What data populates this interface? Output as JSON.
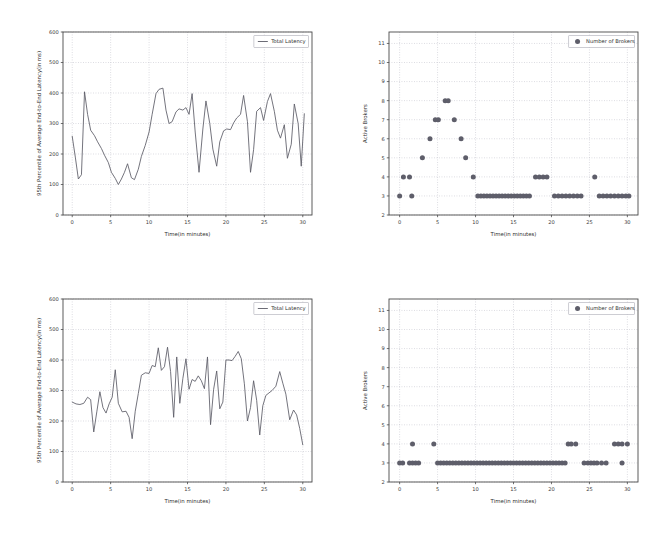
{
  "figure": {
    "background_color": "#ffffff",
    "line_color": "#5b5b66",
    "marker_color": "#5e5e6a",
    "grid_color": "#b9b9c4",
    "axis_color": "#4a4a4a",
    "panel_count": 4,
    "layout": "2x2"
  },
  "panels": [
    {
      "id": "top-left-latency",
      "position": "top-left",
      "legend_label": "Total Latency",
      "legend_icon": "line-swatch",
      "xlabel": "Time(in minutes)",
      "ylabel": "95th Percentile of Average End-to-End Latency(in ms)",
      "xticks": [
        "0",
        "5",
        "10",
        "15",
        "20",
        "25",
        "30"
      ],
      "yticks": [
        "0",
        "100",
        "200",
        "300",
        "400",
        "500",
        "600"
      ]
    },
    {
      "id": "top-right-brokers",
      "position": "top-right",
      "legend_label": "Number of Brokers",
      "legend_icon": "dot-swatch",
      "xlabel": "Time(in minutes)",
      "ylabel": "Active Brokers",
      "xticks": [
        "0",
        "5",
        "10",
        "15",
        "20",
        "25",
        "30"
      ],
      "yticks": [
        "2",
        "3",
        "4",
        "5",
        "6",
        "7",
        "8",
        "9",
        "10",
        "11"
      ]
    },
    {
      "id": "bottom-left-latency",
      "position": "bottom-left",
      "legend_label": "Total Latency",
      "legend_icon": "line-swatch",
      "xlabel": "Time(in minutes)",
      "ylabel": "95th Percentile of Average End-to-End Latency(in ms)",
      "xticks": [
        "0",
        "5",
        "10",
        "15",
        "20",
        "25",
        "30"
      ],
      "yticks": [
        "0",
        "100",
        "200",
        "300",
        "400",
        "500",
        "600"
      ]
    },
    {
      "id": "bottom-right-brokers",
      "position": "bottom-right",
      "legend_label": "Number of Brokers",
      "legend_icon": "dot-swatch",
      "xlabel": "Time(in minutes)",
      "ylabel": "Active Brokers",
      "xticks": [
        "0",
        "5",
        "10",
        "15",
        "20",
        "25",
        "30"
      ],
      "yticks": [
        "2",
        "3",
        "4",
        "5",
        "6",
        "7",
        "8",
        "9",
        "10",
        "11"
      ]
    }
  ],
  "chart_data": [
    {
      "type": "line",
      "id": "top-left-latency",
      "title": "",
      "xlabel": "Time(in minutes)",
      "ylabel": "95th Percentile of Average End-to-End Latency(in ms)",
      "xlim": [
        -1.2,
        31.2
      ],
      "ylim": [
        0,
        600
      ],
      "xticks": [
        0,
        5,
        10,
        15,
        20,
        25,
        30
      ],
      "yticks": [
        0,
        100,
        200,
        300,
        400,
        500,
        600
      ],
      "grid": true,
      "legend": [
        "Total Latency"
      ],
      "legend_position": "upper right",
      "series": [
        {
          "name": "Total Latency",
          "x": [
            0.0,
            0.4,
            0.8,
            1.2,
            1.6,
            2.0,
            2.4,
            2.9,
            3.3,
            3.8,
            4.2,
            4.7,
            5.1,
            5.6,
            6.0,
            6.4,
            6.8,
            7.2,
            7.7,
            8.1,
            8.6,
            9.0,
            9.5,
            10.0,
            10.4,
            10.9,
            11.3,
            11.8,
            12.2,
            12.6,
            13.0,
            13.5,
            13.9,
            14.4,
            14.8,
            15.2,
            15.6,
            16.0,
            16.5,
            17.0,
            17.4,
            17.9,
            18.3,
            18.8,
            19.2,
            19.7,
            20.1,
            20.6,
            21.0,
            21.4,
            21.9,
            22.3,
            22.8,
            23.2,
            23.6,
            24.0,
            24.5,
            24.9,
            25.4,
            25.8,
            26.3,
            26.7,
            27.1,
            27.6,
            28.0,
            28.5,
            28.9,
            29.4,
            29.8,
            30.2
          ],
          "y": [
            258,
            190,
            118,
            132,
            404,
            330,
            278,
            260,
            240,
            218,
            196,
            172,
            140,
            120,
            100,
            118,
            140,
            168,
            122,
            116,
            150,
            192,
            228,
            272,
            330,
            398,
            412,
            416,
            344,
            300,
            306,
            338,
            348,
            344,
            352,
            330,
            398,
            272,
            140,
            282,
            374,
            300,
            216,
            160,
            240,
            276,
            282,
            280,
            302,
            318,
            330,
            392,
            306,
            140,
            214,
            340,
            352,
            310,
            372,
            398,
            340,
            278,
            252,
            296,
            186,
            232,
            364,
            300,
            160,
            332
          ]
        }
      ]
    },
    {
      "type": "scatter",
      "id": "top-right-brokers",
      "title": "",
      "xlabel": "Time(in minutes)",
      "ylabel": "Active Brokers",
      "xlim": [
        -1.4,
        31.4
      ],
      "ylim": [
        2,
        11.6
      ],
      "xticks": [
        0,
        5,
        10,
        15,
        20,
        25,
        30
      ],
      "yticks": [
        2,
        3,
        4,
        5,
        6,
        7,
        8,
        9,
        10,
        11
      ],
      "grid": true,
      "legend": [
        "Number of Brokers"
      ],
      "legend_position": "upper right",
      "series": [
        {
          "name": "Number of Brokers",
          "x": [
            0.0,
            0.5,
            1.3,
            1.6,
            3.0,
            4.0,
            4.7,
            5.1,
            6.0,
            6.4,
            7.2,
            8.1,
            8.7,
            9.7,
            10.3,
            10.7,
            11.1,
            11.5,
            11.9,
            12.3,
            12.7,
            13.1,
            13.5,
            13.9,
            14.3,
            14.7,
            15.1,
            15.5,
            15.9,
            16.3,
            16.7,
            17.1,
            17.9,
            18.4,
            18.9,
            19.4,
            20.4,
            20.9,
            21.4,
            21.9,
            22.4,
            22.9,
            23.4,
            23.9,
            25.7,
            26.3,
            26.8,
            27.3,
            27.8,
            28.3,
            28.8,
            29.3,
            29.8,
            30.2
          ],
          "y": [
            3,
            4,
            4,
            3,
            5,
            6,
            7,
            7,
            8,
            8,
            7,
            6,
            5,
            4,
            3,
            3,
            3,
            3,
            3,
            3,
            3,
            3,
            3,
            3,
            3,
            3,
            3,
            3,
            3,
            3,
            3,
            3,
            4,
            4,
            4,
            4,
            3,
            3,
            3,
            3,
            3,
            3,
            3,
            3,
            4,
            3,
            3,
            3,
            3,
            3,
            3,
            3,
            3,
            3
          ]
        }
      ]
    },
    {
      "type": "line",
      "id": "bottom-left-latency",
      "title": "",
      "xlabel": "Time(in minutes)",
      "ylabel": "95th Percentile of Average End-to-End Latency(in ms)",
      "xlim": [
        -1.2,
        31.2
      ],
      "ylim": [
        0,
        600
      ],
      "xticks": [
        0,
        5,
        10,
        15,
        20,
        25,
        30
      ],
      "yticks": [
        0,
        100,
        200,
        300,
        400,
        500,
        600
      ],
      "grid": true,
      "legend": [
        "Total Latency"
      ],
      "legend_position": "upper right",
      "series": [
        {
          "name": "Total Latency",
          "x": [
            0.0,
            0.5,
            1.0,
            1.5,
            2.0,
            2.4,
            2.8,
            3.2,
            3.6,
            4.0,
            4.4,
            4.8,
            5.2,
            5.6,
            6.0,
            6.5,
            7.0,
            7.4,
            7.8,
            8.2,
            8.6,
            9.0,
            9.5,
            10.0,
            10.4,
            10.8,
            11.2,
            11.6,
            12.0,
            12.4,
            12.8,
            13.2,
            13.6,
            14.0,
            14.4,
            14.8,
            15.2,
            15.6,
            16.0,
            16.4,
            16.8,
            17.2,
            17.6,
            18.0,
            18.4,
            18.8,
            19.2,
            19.6,
            20.0,
            20.4,
            20.8,
            21.2,
            21.6,
            22.0,
            22.4,
            22.8,
            23.2,
            23.6,
            24.0,
            24.4,
            24.8,
            25.2,
            25.6,
            26.0,
            26.5,
            27.0,
            27.4,
            27.8,
            28.3,
            28.8,
            29.2,
            29.6,
            30.0
          ],
          "y": [
            262,
            256,
            254,
            258,
            278,
            270,
            164,
            230,
            296,
            244,
            226,
            256,
            278,
            368,
            258,
            230,
            232,
            212,
            142,
            232,
            290,
            350,
            358,
            356,
            382,
            378,
            440,
            366,
            378,
            442,
            362,
            212,
            410,
            258,
            340,
            404,
            304,
            336,
            330,
            348,
            332,
            306,
            410,
            188,
            304,
            364,
            240,
            262,
            400,
            400,
            398,
            412,
            428,
            404,
            322,
            200,
            244,
            332,
            268,
            154,
            250,
            284,
            292,
            300,
            314,
            362,
            324,
            288,
            204,
            236,
            220,
            176,
            122
          ]
        }
      ]
    },
    {
      "type": "scatter",
      "id": "bottom-right-brokers",
      "title": "",
      "xlabel": "Time(in minutes)",
      "ylabel": "Active Brokers",
      "xlim": [
        -1.4,
        31.4
      ],
      "ylim": [
        2,
        11.6
      ],
      "xticks": [
        0,
        5,
        10,
        15,
        20,
        25,
        30
      ],
      "yticks": [
        2,
        3,
        4,
        5,
        6,
        7,
        8,
        9,
        10,
        11
      ],
      "grid": true,
      "legend": [
        "Number of Brokers"
      ],
      "legend_position": "upper right",
      "series": [
        {
          "name": "Number of Brokers",
          "x": [
            0.0,
            0.4,
            1.3,
            1.7,
            2.1,
            2.5,
            1.7,
            4.5,
            5.0,
            5.4,
            5.8,
            6.2,
            6.6,
            7.0,
            7.4,
            7.8,
            8.2,
            8.6,
            9.0,
            9.4,
            9.8,
            10.2,
            10.6,
            11.0,
            11.4,
            11.8,
            12.2,
            12.6,
            13.0,
            13.4,
            13.8,
            14.2,
            14.6,
            15.0,
            15.4,
            15.8,
            16.2,
            16.6,
            17.0,
            17.4,
            17.8,
            18.2,
            18.6,
            19.0,
            19.4,
            19.8,
            20.2,
            20.6,
            21.0,
            21.4,
            21.8,
            22.2,
            22.6,
            23.2,
            24.3,
            24.8,
            25.2,
            25.6,
            26.0,
            26.6,
            27.2,
            28.3,
            28.8,
            29.3,
            29.3,
            30.0
          ],
          "y": [
            3,
            3,
            3,
            3,
            3,
            3,
            4,
            4,
            3,
            3,
            3,
            3,
            3,
            3,
            3,
            3,
            3,
            3,
            3,
            3,
            3,
            3,
            3,
            3,
            3,
            3,
            3,
            3,
            3,
            3,
            3,
            3,
            3,
            3,
            3,
            3,
            3,
            3,
            3,
            3,
            3,
            3,
            3,
            3,
            3,
            3,
            3,
            3,
            3,
            3,
            3,
            4,
            4,
            4,
            3,
            3,
            3,
            3,
            3,
            3,
            3,
            4,
            4,
            4,
            3,
            4
          ]
        }
      ]
    }
  ]
}
